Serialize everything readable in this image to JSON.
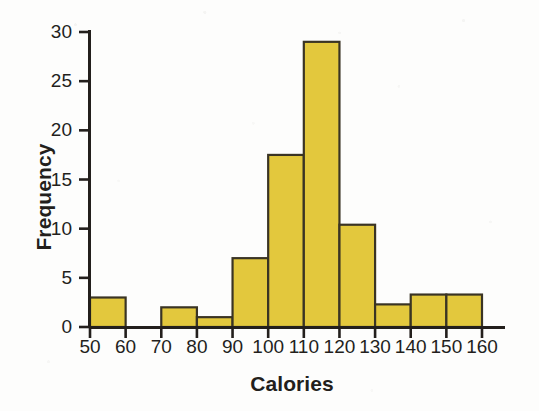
{
  "chart_data": {
    "type": "bar",
    "title": "",
    "subtitle": "",
    "xlabel": "Calories",
    "ylabel": "Frequency",
    "bin_width": 10,
    "categories": [
      "50-60",
      "60-70",
      "70-80",
      "80-90",
      "90-100",
      "100-110",
      "110-120",
      "120-130",
      "130-140",
      "140-150",
      "150-160"
    ],
    "bin_starts": [
      50,
      60,
      70,
      80,
      90,
      100,
      110,
      120,
      130,
      140,
      150
    ],
    "values": [
      3,
      0,
      2,
      1,
      7,
      17.5,
      29,
      10.4,
      2.3,
      3.3,
      3.3
    ],
    "xlim": [
      50,
      160
    ],
    "ylim": [
      0,
      30
    ],
    "xticks": [
      50,
      60,
      70,
      80,
      90,
      100,
      110,
      120,
      130,
      140,
      150,
      160
    ],
    "yticks": [
      0,
      5,
      10,
      15,
      20,
      25,
      30
    ],
    "xtick_labels": [
      "50",
      "60",
      "70",
      "80",
      "90",
      "100",
      "110",
      "120",
      "130",
      "140",
      "150",
      "160"
    ],
    "ytick_labels": [
      "0",
      "5",
      "10",
      "15",
      "20",
      "25",
      "30"
    ],
    "grid": false,
    "legend": false,
    "legend_position": "none",
    "annotations": []
  },
  "style": {
    "bar_fill": "#e3c83d",
    "bar_stroke": "#3a3424",
    "axis_color": "#231f1c",
    "text_color": "#231f1c",
    "background": "#fdfdfc"
  }
}
